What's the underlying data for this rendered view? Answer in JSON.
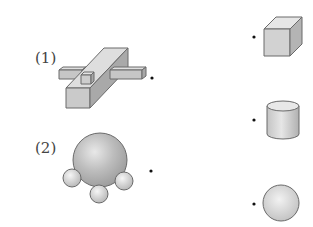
{
  "left_items": [
    {
      "label": "(1)",
      "shape": "cross-beam-composite"
    },
    {
      "label": "(2)",
      "shape": "sphere-with-three-small-spheres"
    }
  ],
  "right_items": [
    {
      "shape": "cube"
    },
    {
      "shape": "cylinder"
    },
    {
      "shape": "sphere"
    }
  ],
  "colors": {
    "stroke": "#6a6a6a",
    "face_light": "#dcdcdc",
    "face_mid": "#c8c8c8",
    "face_dark": "#a9a9a9",
    "dot": "#111111"
  }
}
